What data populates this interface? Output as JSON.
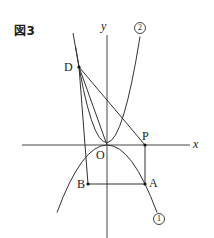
{
  "figure": {
    "title": "図3",
    "axes": {
      "x_label": "x",
      "y_label": "y",
      "origin_label": "O"
    },
    "points": {
      "D": {
        "label": "D",
        "x": 79,
        "y": 67
      },
      "P": {
        "label": "P",
        "x": 145,
        "y": 145
      },
      "A": {
        "label": "A",
        "x": 145,
        "y": 184
      },
      "B": {
        "label": "B",
        "x": 88,
        "y": 184
      },
      "O": {
        "label": "O",
        "x": 107,
        "y": 145
      }
    },
    "curves": [
      {
        "id": "1",
        "label": "①",
        "description": "parabola opening downward through O and A"
      },
      {
        "id": "2",
        "label": "②",
        "description": "parabola opening upward through O and D"
      }
    ],
    "segments": [
      "D-P",
      "D-B",
      "D-O",
      "P-A",
      "A-B"
    ],
    "colors": {
      "line": "#333333",
      "text": "#222222",
      "background": "#ffffff"
    }
  }
}
